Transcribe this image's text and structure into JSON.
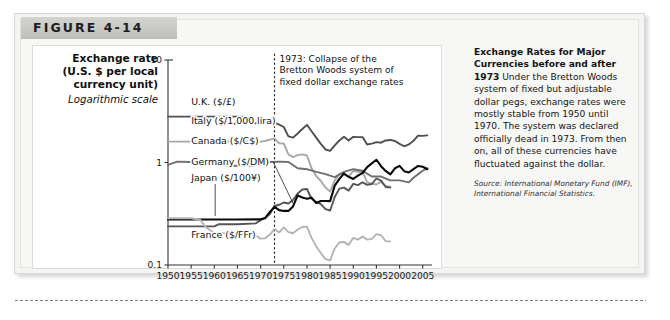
{
  "figure": {
    "banner_label": "FIGURE 4-14"
  },
  "axis_title": {
    "line1": "Exchange rate",
    "line2": "(U.S. $ per local",
    "line3": "currency unit)",
    "scale_note": "Logarithmic scale"
  },
  "annotation": {
    "line1": "1973: Collapse of the",
    "line2": "Bretton Woods system of",
    "line3": "fixed dollar exchange rates",
    "year": 1973
  },
  "caption": {
    "title": "Exchange Rates for Major Currencies before and after 1973",
    "body": " Under the Bretton Woods system of fixed but adjustable dollar pegs, exchange rates were mostly stable from 1950 until 1970. The system was declared officially dead in 1973. From then on, all of these currencies have fluctuated against the dollar.",
    "source": "Source: International Monetary Fund (IMF), International Financial Statistics."
  },
  "chart_data": {
    "type": "line",
    "title": "Exchange Rates for Major Currencies before and after 1973",
    "xlabel": "",
    "ylabel": "Exchange rate (U.S. $ per local currency unit)",
    "yscale": "log",
    "ylim": [
      0.1,
      10
    ],
    "xlim": [
      1950,
      2007
    ],
    "ytick_labels": [
      "10",
      "1",
      "0.1"
    ],
    "ytick_values": [
      10,
      1,
      0.1
    ],
    "xtick_labels": [
      "1950",
      "1955",
      "1960",
      "1965",
      "1970",
      "1975",
      "1980",
      "1985",
      "1990",
      "1995",
      "2000",
      "2005"
    ],
    "xtick_values": [
      1950,
      1955,
      1960,
      1965,
      1970,
      1975,
      1980,
      1985,
      1990,
      1995,
      2000,
      2005
    ],
    "grid": false,
    "legend": "inline-labels",
    "series": [
      {
        "name": "U.K. ($/£)",
        "color": "#4f4f4f",
        "label_x": 1955,
        "label_y": 3.6,
        "x": [
          1950,
          1955,
          1960,
          1965,
          1967,
          1968,
          1970,
          1972,
          1973,
          1974,
          1975,
          1976,
          1977,
          1978,
          1979,
          1980,
          1981,
          1982,
          1983,
          1984,
          1985,
          1986,
          1987,
          1988,
          1989,
          1990,
          1991,
          1992,
          1993,
          1994,
          1995,
          1996,
          1997,
          1998,
          1999,
          2000,
          2001,
          2002,
          2003,
          2004,
          2005,
          2006
        ],
        "y": [
          2.8,
          2.8,
          2.8,
          2.8,
          2.78,
          2.42,
          2.4,
          2.5,
          2.45,
          2.34,
          2.22,
          1.8,
          1.75,
          1.92,
          2.12,
          2.33,
          2.02,
          1.75,
          1.52,
          1.34,
          1.3,
          1.47,
          1.64,
          1.78,
          1.64,
          1.78,
          1.77,
          1.77,
          1.5,
          1.53,
          1.58,
          1.56,
          1.64,
          1.66,
          1.62,
          1.52,
          1.44,
          1.5,
          1.63,
          1.83,
          1.82,
          1.84
        ]
      },
      {
        "name": "Italy ($/1,000 lira)",
        "color": "#a8a8a8",
        "label_x": 1955,
        "label_y": 2.35,
        "x": [
          1950,
          1955,
          1960,
          1965,
          1970,
          1971,
          1973,
          1974,
          1975,
          1976,
          1977,
          1978,
          1979,
          1980,
          1981,
          1982,
          1983,
          1984,
          1985,
          1986,
          1987,
          1988,
          1989,
          1990,
          1991,
          1992,
          1993,
          1994,
          1995,
          1996,
          1997,
          1998
        ],
        "y": [
          1.6,
          1.6,
          1.61,
          1.6,
          1.6,
          1.62,
          1.72,
          1.54,
          1.53,
          1.2,
          1.13,
          1.18,
          1.2,
          1.17,
          0.88,
          0.74,
          0.66,
          0.57,
          0.52,
          0.67,
          0.77,
          0.77,
          0.73,
          0.83,
          0.81,
          0.81,
          0.64,
          0.62,
          0.61,
          0.65,
          0.59,
          0.58
        ]
      },
      {
        "name": "Canada ($/C$)",
        "color": "#6f6f6f",
        "label_x": 1955,
        "label_y": 1.52,
        "x": [
          1950,
          1952,
          1955,
          1957,
          1960,
          1962,
          1964,
          1966,
          1968,
          1970,
          1972,
          1974,
          1976,
          1978,
          1980,
          1982,
          1984,
          1986,
          1988,
          1990,
          1992,
          1994,
          1996,
          1998,
          2000,
          2002,
          2003,
          2004,
          2005,
          2006
        ],
        "y": [
          0.95,
          1.02,
          1.01,
          1.04,
          1.03,
          0.94,
          0.93,
          0.93,
          0.93,
          0.96,
          1.01,
          1.02,
          1.01,
          0.88,
          0.86,
          0.81,
          0.77,
          0.72,
          0.81,
          0.86,
          0.83,
          0.73,
          0.73,
          0.67,
          0.67,
          0.64,
          0.71,
          0.77,
          0.83,
          0.88
        ]
      },
      {
        "name": "Germany ($/DM)",
        "color": "#555555",
        "label_x": 1955,
        "label_y": 0.95,
        "x": [
          1950,
          1955,
          1960,
          1961,
          1965,
          1969,
          1970,
          1971,
          1972,
          1973,
          1974,
          1975,
          1976,
          1977,
          1978,
          1979,
          1980,
          1981,
          1982,
          1983,
          1984,
          1985,
          1986,
          1987,
          1988,
          1989,
          1990,
          1991,
          1992,
          1993,
          1994,
          1995,
          1996,
          1997,
          1998
        ],
        "y": [
          0.238,
          0.238,
          0.238,
          0.25,
          0.25,
          0.255,
          0.274,
          0.287,
          0.314,
          0.376,
          0.387,
          0.407,
          0.398,
          0.431,
          0.498,
          0.546,
          0.551,
          0.443,
          0.412,
          0.392,
          0.351,
          0.34,
          0.461,
          0.556,
          0.569,
          0.532,
          0.619,
          0.602,
          0.641,
          0.605,
          0.617,
          0.698,
          0.665,
          0.577,
          0.569
        ]
      },
      {
        "name": "Japan ($/100¥)",
        "color": "#0a0a0a",
        "label_x": 1955,
        "label_y": 0.66,
        "x": [
          1950,
          1955,
          1960,
          1965,
          1970,
          1971,
          1972,
          1973,
          1974,
          1975,
          1976,
          1977,
          1978,
          1979,
          1980,
          1981,
          1982,
          1983,
          1984,
          1985,
          1986,
          1987,
          1988,
          1989,
          1990,
          1991,
          1992,
          1993,
          1994,
          1995,
          1996,
          1997,
          1998,
          1999,
          2000,
          2001,
          2002,
          2003,
          2004,
          2005,
          2006
        ],
        "y": [
          0.278,
          0.278,
          0.278,
          0.278,
          0.279,
          0.288,
          0.33,
          0.369,
          0.343,
          0.337,
          0.337,
          0.373,
          0.477,
          0.456,
          0.443,
          0.454,
          0.402,
          0.421,
          0.421,
          0.42,
          0.595,
          0.692,
          0.78,
          0.725,
          0.691,
          0.743,
          0.79,
          0.9,
          0.979,
          1.064,
          0.92,
          0.827,
          0.766,
          0.878,
          0.928,
          0.823,
          0.799,
          0.863,
          0.925,
          0.909,
          0.86
        ]
      },
      {
        "name": "France ($/FFr)",
        "color": "#b4b4b4",
        "label_x": 1955,
        "label_y": 0.185,
        "x": [
          1950,
          1955,
          1957,
          1958,
          1960,
          1962,
          1965,
          1968,
          1969,
          1970,
          1971,
          1972,
          1973,
          1974,
          1975,
          1976,
          1977,
          1978,
          1979,
          1980,
          1981,
          1982,
          1983,
          1984,
          1985,
          1986,
          1987,
          1988,
          1989,
          1990,
          1991,
          1992,
          1993,
          1994,
          1995,
          1996,
          1997,
          1998
        ],
        "y": [
          0.286,
          0.286,
          0.275,
          0.238,
          0.204,
          0.204,
          0.204,
          0.202,
          0.193,
          0.181,
          0.182,
          0.198,
          0.225,
          0.208,
          0.233,
          0.209,
          0.204,
          0.222,
          0.235,
          0.237,
          0.184,
          0.152,
          0.131,
          0.114,
          0.111,
          0.145,
          0.166,
          0.168,
          0.157,
          0.184,
          0.177,
          0.189,
          0.177,
          0.18,
          0.2,
          0.195,
          0.171,
          0.17
        ]
      }
    ]
  }
}
